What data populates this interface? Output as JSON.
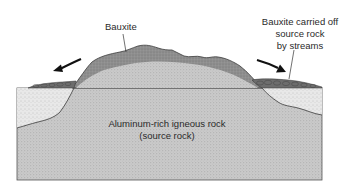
{
  "diagram": {
    "labels": {
      "bauxite": "Bauxite",
      "carried_off": [
        "Bauxite carried off",
        "source rock",
        "by streams"
      ],
      "source_rock": [
        "Aluminum-rich igneous rock",
        "(source rock)"
      ]
    },
    "arrows": [
      {
        "name": "left-transport-arrow",
        "direction": "down-left"
      },
      {
        "name": "right-transport-arrow",
        "direction": "down-right"
      }
    ],
    "colors": {
      "background": "#ffffff",
      "outline": "#4a4a4a",
      "bauxite_layer": "#8f8f8f",
      "source_rock": "#c9c9c9",
      "sediment": "#e6e6e6",
      "gravel": "#7a7a7a",
      "arrow": "#111111",
      "text": "#2a2a2a"
    }
  }
}
